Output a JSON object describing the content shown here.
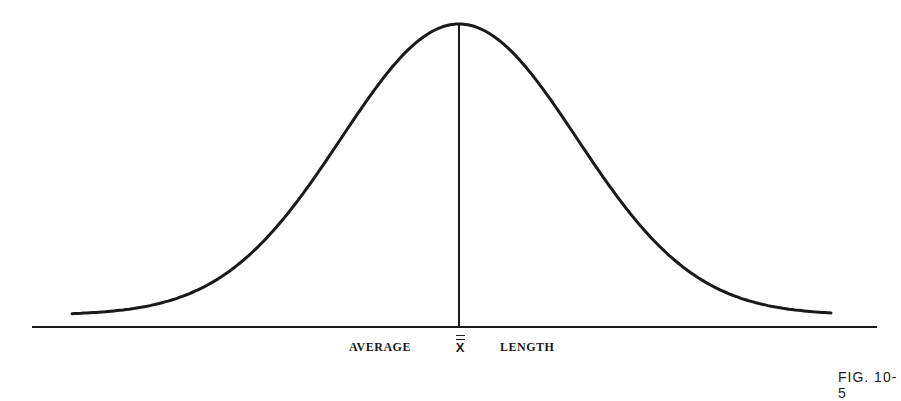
{
  "figure": {
    "label_left": "AVERAGE",
    "mean_symbol": "X",
    "label_right": "LENGTH",
    "figure_number": "FIG. 10-5"
  },
  "chart_data": {
    "type": "line",
    "title": "",
    "xlabel": "AVERAGE X̿ LENGTH",
    "ylabel": "",
    "series": [
      {
        "name": "normal distribution",
        "mean_position": "center",
        "shape": "bell curve, symmetric"
      }
    ],
    "annotations": [
      "vertical line at mean (X double-bar)"
    ],
    "grid": false,
    "legend": "none"
  }
}
